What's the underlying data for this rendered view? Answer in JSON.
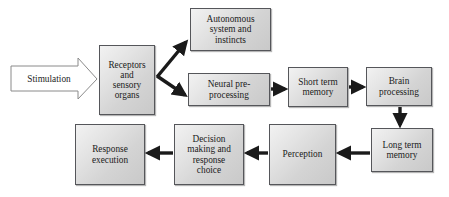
{
  "diagram": {
    "background_color": "#ffffff",
    "node_fill_color": "#d8d8d8",
    "node_border_color": "#55565a",
    "arrow_color": "#1a1a1a",
    "stimulation": {
      "label": "Stimulation",
      "shape": "block-arrow",
      "fill": "#ffffff",
      "border": "#8a8a8a"
    },
    "nodes": [
      {
        "id": "autonomous",
        "label": "Autonomous\nsystem and\ninstincts"
      },
      {
        "id": "receptors",
        "label": "Receptors\nand\nsensory\norgans"
      },
      {
        "id": "neural",
        "label": "Neural pre-\nprocessing"
      },
      {
        "id": "short",
        "label": "Short term\nmemory"
      },
      {
        "id": "brain",
        "label": "Brain\nprocessing"
      },
      {
        "id": "long",
        "label": "Long term\nmemory"
      },
      {
        "id": "perception",
        "label": "Perception"
      },
      {
        "id": "decision",
        "label": "Decision\nmaking and\nresponse\nchoice"
      },
      {
        "id": "response",
        "label": "Response\nexecution"
      }
    ],
    "edges": [
      {
        "from": "stimulation",
        "to": "receptors",
        "direction": "right"
      },
      {
        "from": "receptors",
        "to": "autonomous",
        "direction": "up-right"
      },
      {
        "from": "receptors",
        "to": "neural",
        "direction": "down-right"
      },
      {
        "from": "neural",
        "to": "short",
        "direction": "right"
      },
      {
        "from": "short",
        "to": "brain",
        "direction": "right"
      },
      {
        "from": "brain",
        "to": "long",
        "direction": "down"
      },
      {
        "from": "long",
        "to": "perception",
        "direction": "left"
      },
      {
        "from": "perception",
        "to": "decision",
        "direction": "left"
      },
      {
        "from": "decision",
        "to": "response",
        "direction": "left"
      }
    ]
  }
}
